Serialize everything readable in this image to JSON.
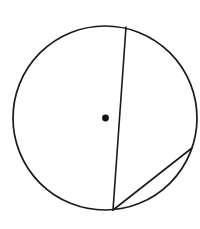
{
  "page": {
    "background_color": "#ffffff",
    "width": 200,
    "height": 229,
    "caption": ""
  },
  "style": {
    "stroke_color": "#1a1a1a",
    "fill_color": "none",
    "dot_color": "#111111",
    "circle_stroke_width": 1.7,
    "chord_stroke_width": 1.6
  },
  "geometry": {
    "circle": {
      "label": "circle-outline",
      "center_x": 105,
      "center_y": 118,
      "radius": 92
    },
    "center_dot": {
      "label": "center-point",
      "x": 105.5,
      "y": 118,
      "radius": 3.4
    },
    "chord_main": {
      "label": "near-diameter-chord",
      "x1": 126,
      "y1": 27,
      "x2": 113,
      "y2": 210
    },
    "chord_secondary": {
      "label": "lower-right-chord",
      "x1": 113,
      "y1": 210,
      "x2": 192,
      "y2": 148
    }
  },
  "chart_data": {
    "type": "diagram",
    "shapes": [
      {
        "name": "circle",
        "center": [
          105,
          118
        ],
        "radius": 92,
        "stroke": "#1a1a1a",
        "fill": "none"
      },
      {
        "name": "center-dot",
        "center": [
          105.5,
          118
        ],
        "radius": 3.4,
        "fill": "#111111"
      },
      {
        "name": "chord-top-to-bottom",
        "points": [
          [
            126,
            27
          ],
          [
            113,
            210
          ]
        ]
      },
      {
        "name": "chord-bottom-to-right",
        "points": [
          [
            113,
            210
          ],
          [
            192,
            148
          ]
        ]
      }
    ],
    "labels": [],
    "annotations": []
  }
}
